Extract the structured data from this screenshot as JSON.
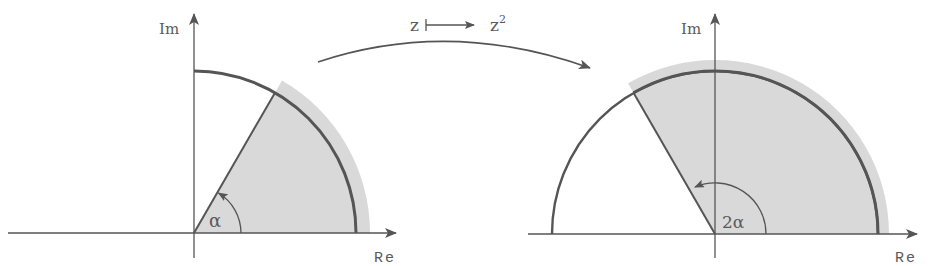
{
  "mapping": {
    "from": "z",
    "to": "z",
    "to_exponent": "2",
    "description": "z ↦ z²"
  },
  "left_plane": {
    "real_axis_label": "Re",
    "imag_axis_label": "Im",
    "angle_label": "α",
    "angle_degrees": 60,
    "radius": 162
  },
  "right_plane": {
    "real_axis_label": "Re",
    "imag_axis_label": "Im",
    "angle_label": "2α",
    "angle_degrees": 120,
    "radius": 163
  },
  "colors": {
    "line": "#555555",
    "shade": "#d9d9d9",
    "text": "#5a5a5a"
  }
}
